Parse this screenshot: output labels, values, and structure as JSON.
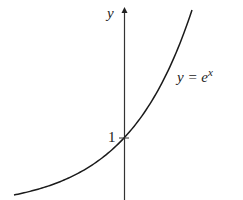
{
  "chart_data": {
    "type": "line",
    "title": "",
    "xlabel": "",
    "ylabel": "y",
    "function": "e^x",
    "curve_label": "y = e",
    "curve_label_sup": "x",
    "annotations": [
      {
        "text": "1",
        "x": 0,
        "y": 1,
        "note": "y-intercept"
      }
    ],
    "y_tick_label": "1",
    "x": [
      -1.7,
      -1,
      -0.5,
      0,
      0.5,
      1,
      1.04
    ],
    "values": [
      0.18,
      0.37,
      0.61,
      1,
      1.65,
      2.72,
      2.83
    ],
    "grid": false,
    "legend": "none"
  },
  "axis": {
    "y_label": "y"
  },
  "labels": {
    "curve_main": "y = e",
    "curve_sup": "x",
    "intercept": "1"
  },
  "colors": {
    "line": "#1a1a1a",
    "axis": "#333333"
  }
}
